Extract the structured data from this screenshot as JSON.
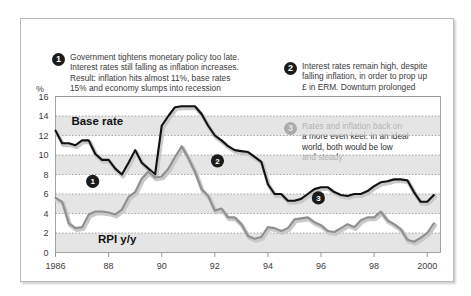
{
  "callouts": [
    {
      "number": "1",
      "text": "Government tightens monetary policy too late.\nInterest rates still falling as inflation increases.\nResult: inflation hits almost 11%, base rates\n15% and economy slumps into recession"
    },
    {
      "number": "2",
      "text": "Interest rates remain high, despite\nfalling inflation, in order to prop up\n£ in ERM. Downturn prolonged"
    },
    {
      "number": "3",
      "text": "Rates and inflation back on\na more even keel. In an ideal\nworld, both would be low\nand steady"
    }
  ],
  "axis_unit_label": "%",
  "colors": {
    "base_rate_line": "#111111",
    "rpi_line": "#8f8f8f",
    "band_shade": "#dcdcdc",
    "card_border": "#b9b9b9",
    "marker_fill": "#1b1b1b",
    "text": "#3b3b3b"
  },
  "in_chart_markers": [
    {
      "number": "1",
      "x_year": 1987.4,
      "y_value": 7.3
    },
    {
      "number": "2",
      "x_year": 1992.1,
      "y_value": 9.4
    },
    {
      "number": "3",
      "x_year": 1995.9,
      "y_value": 5.6
    }
  ],
  "chart_data": {
    "type": "line",
    "title": "",
    "subtitle": "",
    "xlabel": "",
    "ylabel": "%",
    "xlim": [
      1986,
      2000.5
    ],
    "ylim": [
      0,
      16
    ],
    "yticks": [
      0,
      2,
      4,
      6,
      8,
      10,
      12,
      14,
      16
    ],
    "xticks": [
      1986,
      1988,
      1990,
      1992,
      1994,
      1996,
      1998,
      2000
    ],
    "xtick_labels": [
      "1986",
      "88",
      "90",
      "92",
      "94",
      "96",
      "98",
      "2000"
    ],
    "grid": "horizontal-dotted",
    "legend": "inline-labels",
    "series": [
      {
        "name": "Base rate",
        "color": "#111111",
        "label_position": {
          "x_year": 1986.6,
          "y_value": 13.1
        },
        "x": [
          1986.0,
          1986.25,
          1986.5,
          1986.75,
          1987.0,
          1987.25,
          1987.5,
          1987.75,
          1988.0,
          1988.25,
          1988.5,
          1988.75,
          1989.0,
          1989.25,
          1989.5,
          1989.75,
          1990.0,
          1990.25,
          1990.5,
          1990.75,
          1991.0,
          1991.25,
          1991.5,
          1991.75,
          1992.0,
          1992.25,
          1992.5,
          1992.75,
          1993.0,
          1993.25,
          1993.5,
          1993.75,
          1994.0,
          1994.25,
          1994.5,
          1994.75,
          1995.0,
          1995.25,
          1995.5,
          1995.75,
          1996.0,
          1996.25,
          1996.5,
          1996.75,
          1997.0,
          1997.25,
          1997.5,
          1997.75,
          1998.0,
          1998.25,
          1998.5,
          1998.75,
          1999.0,
          1999.25,
          1999.5,
          1999.75,
          2000.0,
          2000.25
        ],
        "y": [
          12.5,
          11.2,
          11.2,
          11.0,
          11.5,
          11.5,
          10.1,
          9.5,
          9.5,
          8.6,
          8.0,
          9.2,
          10.5,
          9.2,
          8.6,
          8.0,
          13.0,
          14.0,
          14.9,
          15.0,
          15.0,
          15.0,
          14.2,
          13.0,
          12.0,
          11.5,
          10.9,
          10.5,
          10.4,
          10.3,
          9.8,
          9.3,
          7.0,
          6.0,
          6.0,
          5.3,
          5.3,
          5.5,
          6.0,
          6.5,
          6.7,
          6.7,
          6.2,
          5.9,
          5.8,
          6.0,
          6.0,
          6.3,
          6.8,
          7.2,
          7.3,
          7.5,
          7.5,
          7.4,
          6.2,
          5.2,
          5.2,
          5.9
        ]
      },
      {
        "name": "RPI y/y",
        "color": "#8f8f8f",
        "label_position": {
          "x_year": 1987.6,
          "y_value": 1.0
        },
        "x": [
          1986.0,
          1986.25,
          1986.5,
          1986.75,
          1987.0,
          1987.25,
          1987.5,
          1987.75,
          1988.0,
          1988.25,
          1988.5,
          1988.75,
          1989.0,
          1989.25,
          1989.5,
          1989.75,
          1990.0,
          1990.25,
          1990.5,
          1990.75,
          1991.0,
          1991.25,
          1991.5,
          1991.75,
          1992.0,
          1992.25,
          1992.5,
          1992.75,
          1993.0,
          1993.25,
          1993.5,
          1993.75,
          1994.0,
          1994.25,
          1994.5,
          1994.75,
          1995.0,
          1995.25,
          1995.5,
          1995.75,
          1996.0,
          1996.25,
          1996.5,
          1996.75,
          1997.0,
          1997.25,
          1997.5,
          1997.75,
          1998.0,
          1998.25,
          1998.5,
          1998.75,
          1999.0,
          1999.25,
          1999.5,
          1999.75,
          2000.0,
          2000.25
        ],
        "y": [
          5.6,
          5.2,
          3.0,
          2.5,
          2.6,
          3.9,
          4.2,
          4.2,
          4.1,
          3.9,
          4.4,
          5.7,
          6.2,
          7.6,
          8.3,
          7.7,
          7.8,
          8.6,
          9.8,
          10.9,
          9.7,
          8.3,
          6.5,
          5.8,
          4.3,
          4.5,
          3.6,
          3.6,
          2.9,
          1.7,
          1.4,
          1.6,
          2.6,
          2.5,
          2.2,
          2.5,
          3.4,
          3.5,
          3.6,
          3.1,
          2.8,
          2.2,
          2.1,
          2.5,
          2.9,
          2.6,
          3.3,
          3.6,
          3.6,
          4.2,
          3.3,
          2.9,
          2.4,
          1.3,
          1.1,
          1.5,
          2.0,
          3.0
        ]
      }
    ],
    "annotations": [
      {
        "number": "1",
        "text": "Government tightens monetary policy too late. Interest rates still falling as inflation increases. Result: inflation hits almost 11%, base rates 15% and economy slumps into recession"
      },
      {
        "number": "2",
        "text": "Interest rates remain high, despite falling inflation, in order to prop up £ in ERM. Downturn prolonged"
      },
      {
        "number": "3",
        "text": "Rates and inflation back on a more even keel. In an ideal world, both would be low and steady"
      }
    ]
  }
}
